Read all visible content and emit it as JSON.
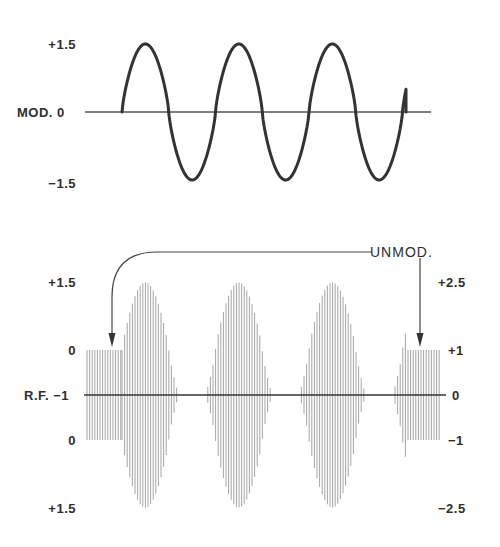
{
  "diagram": {
    "top_plot": {
      "name": "Modulating signal",
      "axis_label": "MOD.",
      "ticks": {
        "top": "+1.5",
        "center": "0",
        "bottom": "-1.5"
      },
      "waveform": "sine",
      "cycles": 3,
      "amplitude": 1.5
    },
    "bottom_plot": {
      "name": "Modulated RF carrier",
      "axis_label": "R.F.",
      "left_ticks": [
        "+1.5",
        "0",
        "-1",
        "0",
        "+1.5"
      ],
      "right_ticks": [
        "+2.5",
        "+1",
        "0",
        "-1",
        "-2.5"
      ],
      "annotation": "UNMOD.",
      "unmodulated_level": 1,
      "peak_level": 2.5,
      "lobes": 3
    },
    "colors": {
      "line": "#333333",
      "carrier": "#9a9a9a",
      "background": "#ffffff"
    }
  },
  "labels": {
    "mod_plus": "+1.5",
    "mod_axis": "MOD. 0",
    "mod_minus": "−1.5",
    "rf_l_top": "+1.5",
    "rf_l_upper0": "0",
    "rf_axis": "R.F. −1",
    "rf_l_lower0": "0",
    "rf_l_bottom": "+1.5",
    "rf_r_top": "+2.5",
    "rf_r_plus1": "+1",
    "rf_r_zero": "0",
    "rf_r_minus1": "−1",
    "rf_r_bottom": "−2.5",
    "unmod": "UNMOD."
  }
}
